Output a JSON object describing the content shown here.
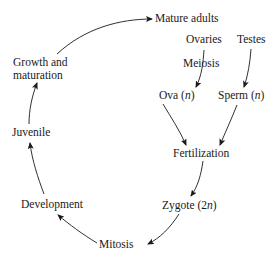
{
  "diagram": {
    "type": "life-cycle",
    "nodes": {
      "mature_adults": "Mature adults",
      "ovaries": "Ovaries",
      "testes": "Testes",
      "meiosis": "Meiosis",
      "ova": "Ova (",
      "ova_var": "n",
      "ova_close": ")",
      "sperm": "Sperm (",
      "sperm_var": "n",
      "sperm_close": ")",
      "fertilization": "Fertilization",
      "zygote": "Zygote (2",
      "zygote_var": "n",
      "zygote_close": ")",
      "mitosis": "Mitosis",
      "development": "Development",
      "juvenile": "Juvenile",
      "growth_line1": "Growth and",
      "growth_line2": "maturation"
    },
    "edges": [
      {
        "from": "Growth and maturation",
        "to": "Mature adults"
      },
      {
        "from": "Ovaries",
        "to": "Ova (n)"
      },
      {
        "from": "Testes",
        "to": "Sperm (n)"
      },
      {
        "from": "Ova (n)",
        "to": "Fertilization"
      },
      {
        "from": "Sperm (n)",
        "to": "Fertilization"
      },
      {
        "from": "Fertilization",
        "to": "Zygote (2n)"
      },
      {
        "from": "Zygote (2n)",
        "to": "Mitosis"
      },
      {
        "from": "Mitosis",
        "to": "Development"
      },
      {
        "from": "Development",
        "to": "Juvenile"
      },
      {
        "from": "Juvenile",
        "to": "Growth and maturation"
      }
    ],
    "colors": {
      "ink": "#1a1a1a",
      "background": "#ffffff"
    }
  }
}
